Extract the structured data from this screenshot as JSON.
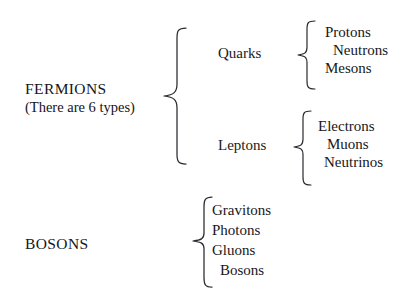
{
  "diagram": {
    "background_color": "#ffffff",
    "text_color": "#16161a",
    "brace_color": "#2a2a30",
    "groups": [
      {
        "name": "fermions",
        "label": "FERMIONS",
        "sublabel": "(There are 6 types)",
        "children": [
          {
            "name": "quarks",
            "label": "Quarks",
            "items": [
              "Protons",
              "Neutrons",
              "Mesons"
            ]
          },
          {
            "name": "leptons",
            "label": "Leptons",
            "items": [
              "Electrons",
              "Muons",
              "Neutrinos"
            ]
          }
        ]
      },
      {
        "name": "bosons",
        "label": "BOSONS",
        "sublabel": "",
        "items": [
          "Gravitons",
          "Photons",
          "Gluons",
          "Bosons"
        ]
      }
    ],
    "braces": {
      "fermions_brace": "left-curly-brace",
      "quarks_brace": "left-curly-brace",
      "leptons_brace": "left-curly-brace",
      "bosons_brace": "left-curly-brace"
    }
  }
}
